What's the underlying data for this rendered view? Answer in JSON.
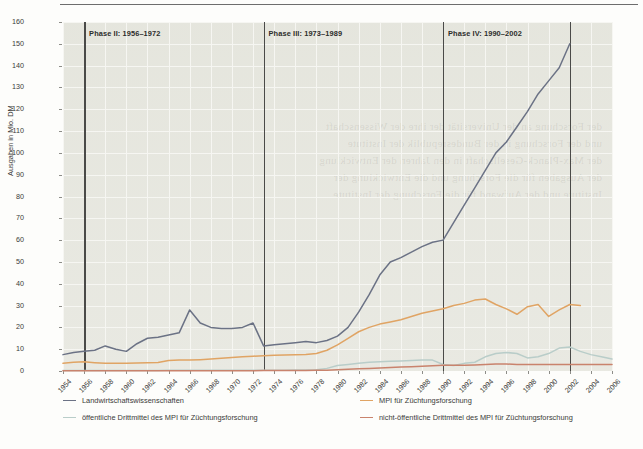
{
  "chart_data": {
    "type": "line",
    "title": "",
    "xlabel": "",
    "ylabel": "Ausgaben in Mio. DM",
    "ylim": [
      0,
      160
    ],
    "ytick_step": 10,
    "xlim": [
      1954,
      2006
    ],
    "xtick_step": 2,
    "grid": true,
    "legend_position": "below",
    "x": [
      1954,
      1955,
      1956,
      1957,
      1958,
      1959,
      1960,
      1961,
      1962,
      1963,
      1964,
      1965,
      1966,
      1967,
      1968,
      1969,
      1970,
      1971,
      1972,
      1973,
      1974,
      1975,
      1976,
      1977,
      1978,
      1979,
      1980,
      1981,
      1982,
      1983,
      1984,
      1985,
      1986,
      1987,
      1988,
      1989,
      1990,
      1991,
      1992,
      1993,
      1994,
      1995,
      1996,
      1997,
      1998,
      1999,
      2000,
      2001,
      2002,
      2003,
      2004,
      2005,
      2006
    ],
    "series": [
      {
        "name": "Landwirtschaftswissenschaften",
        "color": "#6b7285",
        "values": [
          7.5,
          8.5,
          9.0,
          9.5,
          11.5,
          10.0,
          9.0,
          12.5,
          15.0,
          15.5,
          16.5,
          17.5,
          28.0,
          22.0,
          20.0,
          19.5,
          19.5,
          20.0,
          22.0,
          11.5,
          12.0,
          12.5,
          13.0,
          13.5,
          13.0,
          14.0,
          16.0,
          20.0,
          27.0,
          35.0,
          44.0,
          50.0,
          52.0,
          54.5,
          57.0,
          59.0,
          60.0,
          68.0,
          76.0,
          84.0,
          92.0,
          100.0,
          105.0,
          112.0,
          119.0,
          127.0,
          133.0,
          139.0,
          150.0,
          null,
          null,
          null,
          null
        ]
      },
      {
        "name": "MPI für Züchtungsforschung",
        "color": "#e0a464",
        "values": [
          3.5,
          4.0,
          4.2,
          3.8,
          3.5,
          3.6,
          3.6,
          3.7,
          3.8,
          3.9,
          4.8,
          5.0,
          5.0,
          5.2,
          5.5,
          5.8,
          6.2,
          6.5,
          6.8,
          7.0,
          7.2,
          7.3,
          7.4,
          7.6,
          8.0,
          9.5,
          12.0,
          15.0,
          18.0,
          20.0,
          21.5,
          22.5,
          23.5,
          25.0,
          26.5,
          27.5,
          28.5,
          30.0,
          31.0,
          32.5,
          33.0,
          30.5,
          28.5,
          26.0,
          29.5,
          30.5,
          25.0,
          28.0,
          30.5,
          30.0,
          null,
          null,
          null
        ]
      },
      {
        "name": "öffentliche Drittmittel des MPI für Züchtungsforschung",
        "color": "#b9cdc9",
        "values": [
          0.2,
          0.2,
          0.2,
          0.2,
          0.2,
          0.2,
          0.2,
          0.2,
          0.2,
          0.2,
          0.3,
          0.3,
          0.3,
          0.3,
          0.3,
          0.3,
          0.4,
          0.4,
          0.4,
          0.4,
          0.4,
          0.4,
          0.5,
          0.5,
          0.6,
          1.2,
          2.5,
          3.0,
          3.5,
          4.0,
          4.2,
          4.5,
          4.6,
          4.8,
          5.0,
          5.0,
          3.0,
          2.5,
          3.5,
          4.0,
          6.5,
          8.0,
          8.5,
          8.0,
          6.0,
          6.5,
          8.0,
          10.5,
          11.0,
          9.0,
          7.5,
          6.5,
          5.5
        ]
      },
      {
        "name": "nicht-öffentliche Drittmittel des MPI für Züchtungsforschung",
        "color": "#c9836d",
        "values": [
          0.1,
          0.1,
          0.1,
          0.1,
          0.1,
          0.1,
          0.1,
          0.1,
          0.1,
          0.1,
          0.1,
          0.1,
          0.1,
          0.1,
          0.1,
          0.1,
          0.1,
          0.1,
          0.1,
          0.2,
          0.2,
          0.2,
          0.2,
          0.2,
          0.3,
          0.4,
          0.6,
          0.8,
          1.0,
          1.2,
          1.4,
          1.6,
          1.8,
          2.0,
          2.2,
          2.4,
          2.6,
          2.6,
          2.6,
          2.8,
          3.0,
          3.2,
          3.2,
          3.0,
          3.0,
          3.0,
          3.0,
          3.0,
          3.0,
          3.0,
          3.0,
          3.0,
          3.0
        ]
      }
    ],
    "annotations": [
      {
        "label": "Phase II: 1956–1972",
        "x": 1956
      },
      {
        "label": "Phase III: 1973–1989",
        "x": 1973
      },
      {
        "label": "Phase IV: 1990–2002",
        "x": 1990
      }
    ],
    "phase_divider_years": [
      1956,
      1973,
      1990,
      2002
    ],
    "ytick_labels": [
      "0",
      "10",
      "20",
      "30",
      "40",
      "50",
      "60",
      "70",
      "80",
      "90",
      "100",
      "110",
      "120",
      "130",
      "140",
      "150",
      "160"
    ],
    "xtick_labels": [
      "1954",
      "1956",
      "1958",
      "1960",
      "1962",
      "1964",
      "1966",
      "1968",
      "1970",
      "1972",
      "1974",
      "1976",
      "1978",
      "1980",
      "1982",
      "1984",
      "1986",
      "1988",
      "1990",
      "1992",
      "1996",
      "1996",
      "1998",
      "2000",
      "2002",
      "2004",
      "2006"
    ]
  },
  "legend": {
    "items": [
      {
        "label": "Landwirtschaftswissenschaften",
        "color": "#6b7285"
      },
      {
        "label": "MPI für Züchtungsforschung",
        "color": "#e0a464"
      },
      {
        "label": "öffentliche Drittmittel des MPI für Züchtungsforschung",
        "color": "#b9cdc9"
      },
      {
        "label": "nicht-öffentliche Drittmittel des MPI für Züchtungsforschung",
        "color": "#c9836d"
      }
    ]
  },
  "ghost_text": "der Forschung an der Universität der ihre der Wissenschaft\nund der Forschung in der Bundesrepublik der Institute\nder Max-Planck-Gesellschaft in den Jahren der Entwicklung\nder Ausgaben für die Forschung und die Entwicklung der\nInstitute und der Aufwand für die Forschung der Institute"
}
